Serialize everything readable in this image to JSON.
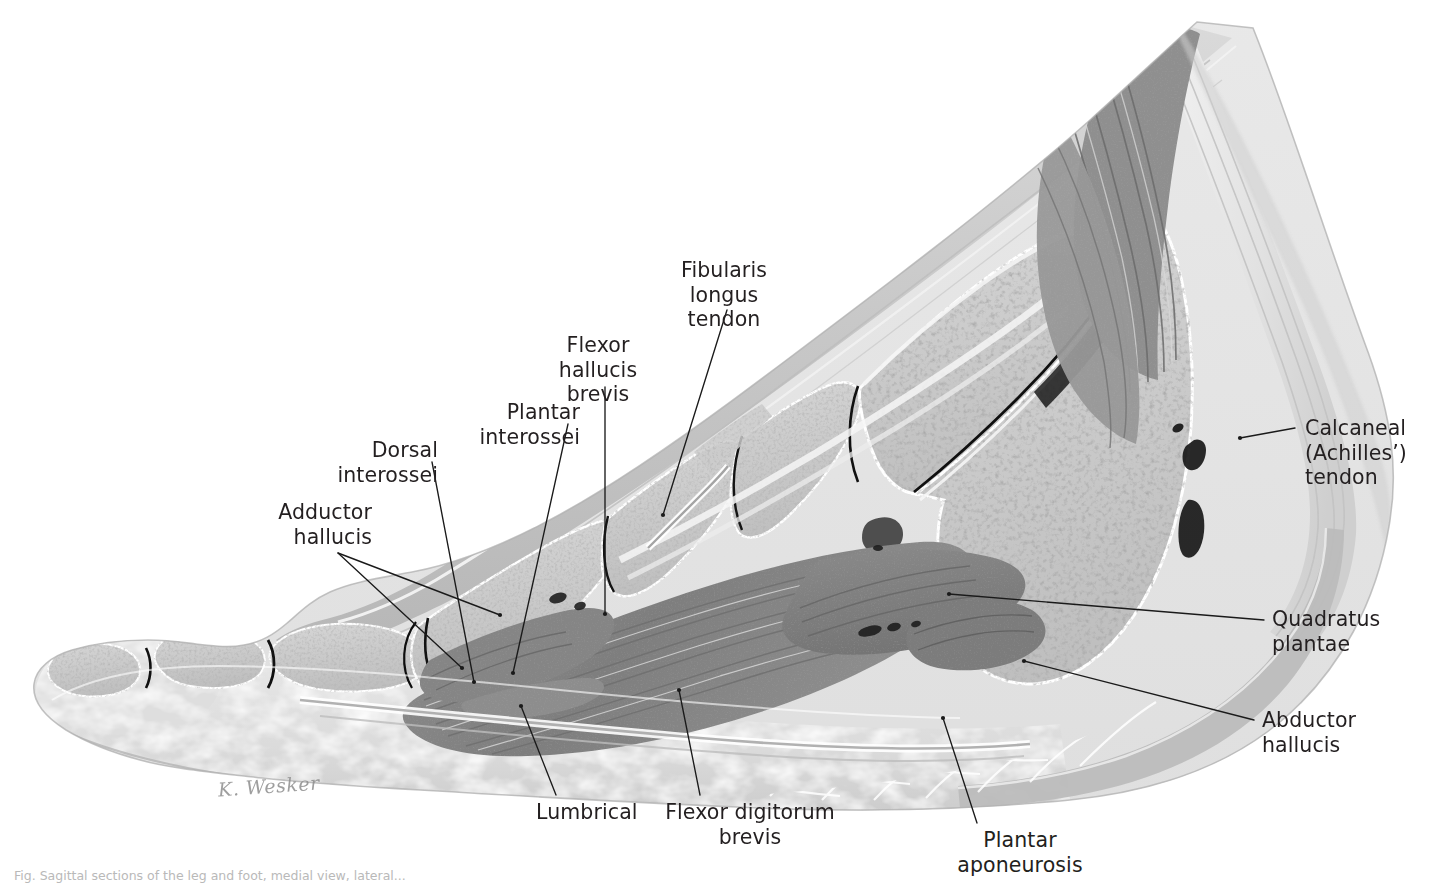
{
  "figure": {
    "artist_signature": "K. Wesker",
    "caption": "Fig. Sagittal sections of the leg and foot, medial view, lateral...",
    "background_color": "#ffffff",
    "ink_color": "#231f20",
    "leader_color": "#1a1a1a"
  },
  "annotations": [
    {
      "id": "fibularis-longus-tendon",
      "text": "Fibularis longus\ntendon",
      "align": "center",
      "label_x": 650,
      "label_y": 258,
      "label_w": 148,
      "leader": [
        [
          727,
          310
        ],
        [
          663,
          515
        ]
      ]
    },
    {
      "id": "flexor-hallucis-brevis",
      "text": "Flexor hallucis\nbrevis",
      "align": "center",
      "label_x": 528,
      "label_y": 333,
      "label_w": 140,
      "leader": [
        [
          605,
          387
        ],
        [
          605,
          614
        ]
      ]
    },
    {
      "id": "plantar-interossei",
      "text": "Plantar interossei",
      "align": "right",
      "label_x": 408,
      "label_y": 400,
      "label_w": 172,
      "leader": [
        [
          568,
          424
        ],
        [
          513,
          673
        ]
      ]
    },
    {
      "id": "dorsal-interossei",
      "text": "Dorsal interossei",
      "align": "right",
      "label_x": 272,
      "label_y": 438,
      "label_w": 166,
      "leader": [
        [
          432,
          462
        ],
        [
          474,
          682
        ]
      ]
    },
    {
      "id": "adductor-hallucis",
      "text": "Adductor\nhallucis",
      "align": "right",
      "label_x": 262,
      "label_y": 500,
      "label_w": 110,
      "leader": [
        [
          338,
          553
        ],
        [
          500,
          615
        ]
      ],
      "leader2": [
        [
          338,
          553
        ],
        [
          462,
          668
        ]
      ]
    },
    {
      "id": "calcaneal-achilles-tendon",
      "text": "Calcaneal\n(Achilles’)\ntendon",
      "align": "left",
      "label_x": 1305,
      "label_y": 416,
      "label_w": 140,
      "leader": [
        [
          1295,
          428
        ],
        [
          1240,
          438
        ]
      ]
    },
    {
      "id": "quadratus-plantae",
      "text": "Quadratus\nplantae",
      "align": "left",
      "label_x": 1272,
      "label_y": 607,
      "label_w": 140,
      "leader": [
        [
          1264,
          620
        ],
        [
          949,
          594
        ]
      ]
    },
    {
      "id": "abductor-hallucis",
      "text": "Abductor\nhallucis",
      "align": "left",
      "label_x": 1262,
      "label_y": 708,
      "label_w": 140,
      "leader": [
        [
          1254,
          720
        ],
        [
          1024,
          661
        ]
      ]
    },
    {
      "id": "lumbrical",
      "text": "Lumbrical",
      "align": "center",
      "label_x": 536,
      "label_y": 800,
      "label_w": 100,
      "leader": [
        [
          556,
          795
        ],
        [
          521,
          706
        ]
      ]
    },
    {
      "id": "flexor-digitorum-brevis",
      "text": "Flexor digitorum brevis",
      "align": "center",
      "label_x": 650,
      "label_y": 800,
      "label_w": 200,
      "leader": [
        [
          700,
          795
        ],
        [
          679,
          690
        ]
      ]
    },
    {
      "id": "plantar-aponeurosis",
      "text": "Plantar aponeurosis",
      "align": "center",
      "label_x": 920,
      "label_y": 828,
      "label_w": 200,
      "leader": [
        [
          977,
          823
        ],
        [
          943,
          718
        ]
      ]
    }
  ],
  "specimen": {
    "type": "sagittal-section-foot",
    "structures": [
      "skin and subcutaneous tissue",
      "distal phalanx",
      "middle phalanx",
      "proximal phalanx",
      "metatarsal",
      "cuneiform",
      "navicular",
      "talus",
      "calcaneus",
      "plantar fat pad",
      "flexor digitorum brevis muscle",
      "quadratus plantae muscle",
      "abductor hallucis muscle",
      "soleus / gastrocnemius muscle",
      "calcaneal tendon",
      "plantar aponeurosis"
    ]
  }
}
